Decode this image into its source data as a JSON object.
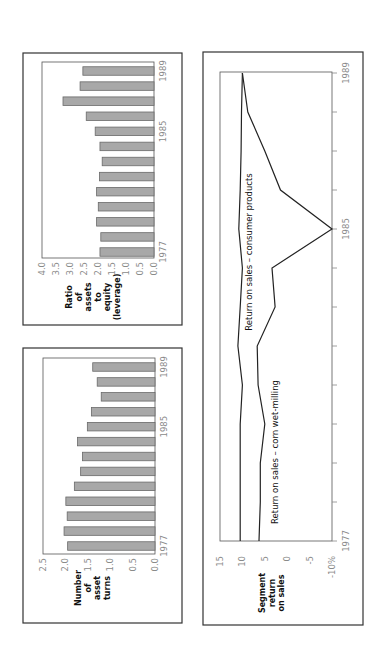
{
  "orientation": "rotated-90-ccw",
  "chart_data": [
    {
      "type": "bar",
      "title": "",
      "ylabel": "Ratio of assets to equity (leverage)",
      "ylabel_lines": [
        "Ratio",
        "of",
        "assets",
        "to",
        "equity",
        "(leverage)"
      ],
      "xlabel": "",
      "categories": [
        "1977",
        "1978",
        "1979",
        "1980",
        "1981",
        "1982",
        "1983",
        "1984",
        "1985",
        "1986",
        "1987",
        "1988",
        "1989"
      ],
      "x_tick_labels": [
        "1977",
        "1985",
        "1989"
      ],
      "values": [
        1.93,
        1.9,
        2.05,
        1.99,
        2.05,
        1.95,
        1.85,
        1.93,
        2.1,
        2.42,
        3.25,
        2.64,
        2.54
      ],
      "ylim": [
        0,
        4.0
      ],
      "y_ticks": [
        "4.0",
        "3.5",
        "3.0",
        "2.5",
        "2.0",
        "1.5",
        "1.0",
        "0.5",
        "0.0"
      ],
      "grid": false
    },
    {
      "type": "bar",
      "title": "",
      "ylabel": "Number of asset turns",
      "ylabel_lines": [
        "Number",
        "of",
        "asset",
        "turns"
      ],
      "xlabel": "",
      "categories": [
        "1977",
        "1978",
        "1979",
        "1980",
        "1981",
        "1982",
        "1983",
        "1984",
        "1985",
        "1986",
        "1987",
        "1988",
        "1989"
      ],
      "x_tick_labels": [
        "1977",
        "1985",
        "1989"
      ],
      "values": [
        1.95,
        2.03,
        1.96,
        1.99,
        1.8,
        1.66,
        1.62,
        1.73,
        1.51,
        1.42,
        1.2,
        1.29,
        1.39
      ],
      "ylim": [
        0,
        2.5
      ],
      "y_ticks": [
        "2.5",
        "2.0",
        "1.5",
        "1.0",
        "0.5",
        "0.0"
      ],
      "grid": false
    },
    {
      "type": "line",
      "title": "",
      "ylabel": "Segment return on sales",
      "ylabel_lines": [
        "Segment",
        "return",
        "on sales"
      ],
      "xlabel": "",
      "x": [
        "1977",
        "1978",
        "1979",
        "1980",
        "1981",
        "1982",
        "1983",
        "1984",
        "1985",
        "1986",
        "1987",
        "1988",
        "1989"
      ],
      "x_tick_labels": [
        "1977",
        "1985",
        "1989"
      ],
      "series": [
        {
          "name": "Return on sales – consumer products",
          "values": [
            10.5,
            10.5,
            10.5,
            10.5,
            10.0,
            11.0,
            10.5,
            10.0,
            10.8,
            10.5,
            10.3,
            10.2,
            10.0
          ]
        },
        {
          "name": "Return on sales – corn wet-milling",
          "values": [
            6.3,
            6.0,
            6.0,
            5.0,
            6.5,
            6.7,
            2.7,
            3.4,
            -10.0,
            1.5,
            5.0,
            8.8,
            10.0
          ]
        }
      ],
      "ylim": [
        -10,
        15
      ],
      "y_ticks": [
        "15",
        "10",
        "5",
        "0",
        "-5",
        "-10%"
      ],
      "grid": false
    }
  ]
}
